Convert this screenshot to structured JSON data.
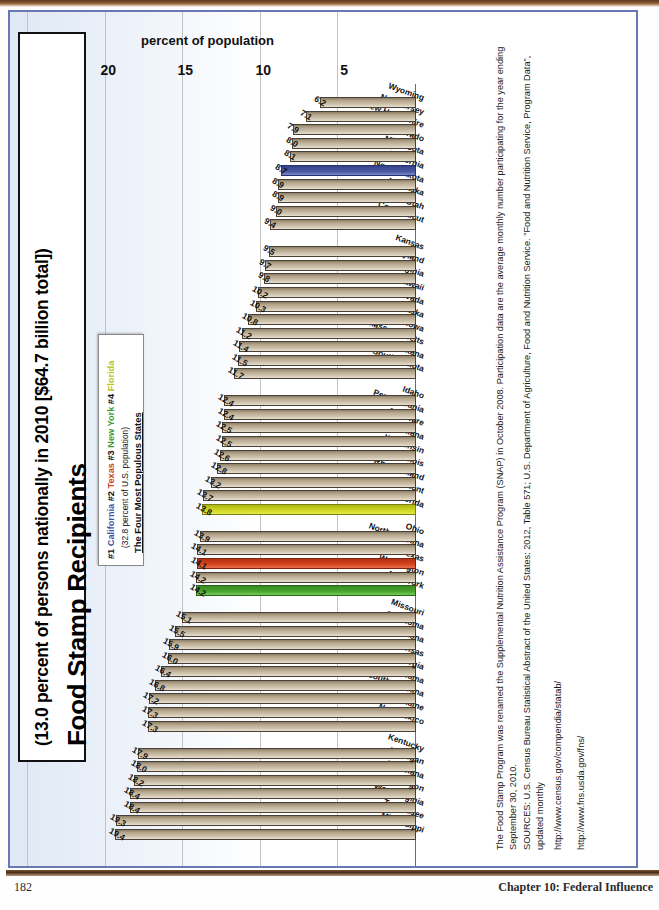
{
  "page": {
    "number": "182",
    "chapter_label": "Chapter 10: Federal Influence"
  },
  "figure": {
    "title": "Food Stamp Recipients",
    "subtitle": "(13.0 percent of persons nationally in 2010 [$64.7 billion total])",
    "legend": {
      "heading": "The Four Most Populous States",
      "note": "(32.8 percent of U.S. population)",
      "items": [
        {
          "rank": "#1",
          "state": "California",
          "color": "#3b53a4"
        },
        {
          "rank": "#2",
          "state": "Texas",
          "color": "#cf4520"
        },
        {
          "rank": "#3",
          "state": "New York",
          "color": "#3f9b35"
        },
        {
          "rank": "#4",
          "state": "Florida",
          "color": "#b9c421"
        }
      ]
    },
    "notes": [
      "The Food Stamp Program was renamed the Supplemental Nutrition Assistance Program (SNAP) in October 2008. Participation data are the average monthly number participating for the year ending September 30, 2010.",
      "SOURCES: U.S. Census Bureau Statistical Abstract of the United States: 2012, Table 571; U.S. Department of Agriculture, Food and Nutrition Service. \"Food and Nutrition Service, Program Data\", updated monthly",
      "http://www.census.gov/compendia/statab/",
      "http://www.fns.usda.gov/fns/"
    ]
  },
  "chart_data": {
    "type": "bar",
    "orientation": "horizontal",
    "title": "Food Stamp Recipients",
    "subtitle": "(13.0 percent of persons nationally in 2010 [$64.7 billion total])",
    "xlabel": "",
    "ylabel": "percent of population",
    "axis_title": "percent of population",
    "ylim": [
      0,
      25
    ],
    "ticks": [
      5,
      10,
      15,
      20,
      25
    ],
    "grid": true,
    "legend_position": "top-left",
    "highlight_colors": {
      "California": "#3b53a4",
      "Texas": "#cf4520",
      "New York": "#3f9b35",
      "Florida": "#b9c421",
      "default": "#b5a68c"
    },
    "categories": [
      "Mississippi",
      "Tennessee",
      "West Virginia",
      "Oregon",
      "Louisiana",
      "Michigan",
      "Kentucky",
      "New Mexico",
      "Maine",
      "South Carolina",
      "Alabama",
      "Georgia",
      "Arkansas",
      "Arizona",
      "Oklahoma",
      "Missouri",
      "New York",
      "Washington",
      "Texas",
      "North Carolina",
      "Ohio",
      "Florida",
      "Vermont",
      "Rhode Island",
      "Illinois",
      "Wisconsin",
      "Indiana",
      "Delaware",
      "Pennsylvania",
      "Idaho",
      "South Dakota",
      "Montana",
      "Massachusetts",
      "Iowa",
      "Alaska",
      "Nevada",
      "Hawaii",
      "Virginia",
      "Maryland",
      "Kansas",
      "Connecticut",
      "Utah",
      "Nebraska",
      "North Dakota",
      "California",
      "Minnesota",
      "Colorado",
      "New Hampshire",
      "New Jersey",
      "Wyoming"
    ],
    "values": [
      19.4,
      19.3,
      18.4,
      18.4,
      18.2,
      18.0,
      17.9,
      17.3,
      17.3,
      17.2,
      16.8,
      16.4,
      16.0,
      15.9,
      15.5,
      15.1,
      14.2,
      14.2,
      14.1,
      14.1,
      13.9,
      13.8,
      13.7,
      13.2,
      12.8,
      12.6,
      12.5,
      12.5,
      12.4,
      12.4,
      11.7,
      11.5,
      11.4,
      11.2,
      10.8,
      10.3,
      10.2,
      9.8,
      9.7,
      9.5,
      9.4,
      9.0,
      8.9,
      8.9,
      8.7,
      8.1,
      8.0,
      7.9,
      7.1,
      6.2
    ]
  }
}
